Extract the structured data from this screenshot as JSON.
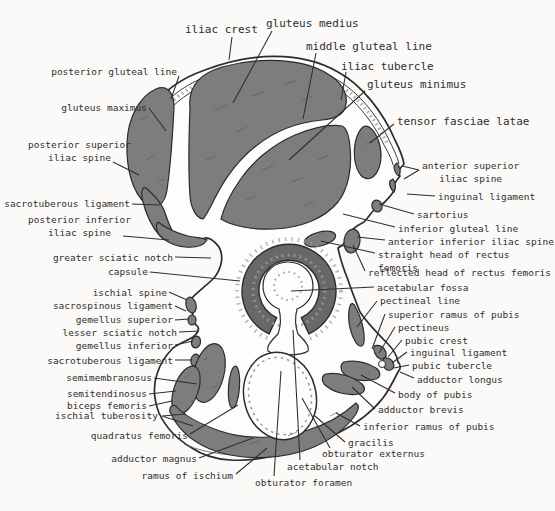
{
  "palette": {
    "background": "#fbfaf8",
    "bone_fill": "#fdfdfc",
    "muscle_gray": "#7d7d7d",
    "acetabulum_ring_gray": "#686868",
    "outline_color": "#2c2c2c",
    "text_color": "#2e2e2e"
  },
  "labels": {
    "iliac_crest": "iliac crest",
    "gluteus_medius": "gluteus medius",
    "middle_gluteal_line": "middle gluteal line",
    "iliac_tubercle": "iliac tubercle",
    "gluteus_minimus": "gluteus minimus",
    "tensor_fasciae_latae": "tensor fasciae latae",
    "anterior_superior_iliac_spine": "anterior superior\niliac spine",
    "inguinal_ligament_upper": "inguinal ligament",
    "sartorius": "sartorius",
    "inferior_gluteal_line": "inferior gluteal line",
    "anterior_inferior_iliac_spine": "anterior inferior iliac spine",
    "straight_head_of_rectus_femoris": "straight head of rectus femoris",
    "reflected_head_of_rectus_femoris": "reflected head of rectus femoris",
    "acetabular_fossa": "acetabular fossa",
    "pectineal_line": "pectineal line",
    "superior_ramus_of_pubis": "superior ramus of pubis",
    "pectineus": "pectineus",
    "pubic_crest": "pubic crest",
    "inguinal_ligament_lower": "inguinal ligament",
    "pubic_tubercle": "pubic tubercle",
    "adductor_longus": "adductor longus",
    "body_of_pubis": "body of pubis",
    "adductor_brevis": "adductor brevis",
    "inferior_ramus_of_pubis": "inferior ramus of pubis",
    "gracilis": "gracilis",
    "obturator_externus": "obturator externus",
    "acetabular_notch": "acetabular notch",
    "obturator_foramen": "obturator foramen",
    "posterior_gluteal_line": "posterior gluteal line",
    "gluteus_maximus": "gluteus maximus",
    "posterior_superior_iliac_spine": "posterior superior\niliac spine",
    "sacrotuberous_ligament_upper": "sacrotuberous ligament",
    "posterior_inferior_iliac_spine": "posterior inferior\niliac spine",
    "greater_sciatic_notch": "greater sciatic notch",
    "capsule": "capsule",
    "ischial_spine": "ischial spine",
    "sacrospinous_ligament": "sacrospinous ligament",
    "gemellus_superior": "gemellus superior",
    "lesser_sciatic_notch": "lesser sciatic notch",
    "gemellus_inferior": "gemellus inferior",
    "sacrotuberous_ligament_lower": "sacrotuberous ligament",
    "semimembranosus": "semimembranosus",
    "semitendinosus": "semitendinosus",
    "biceps_femoris": "biceps femoris",
    "ischial_tuberosity": "ischial tuberosity",
    "quadratus_femoris": "quadratus femoris",
    "adductor_magnus": "adductor magnus",
    "ramus_of_ischium": "ramus of ischium"
  }
}
